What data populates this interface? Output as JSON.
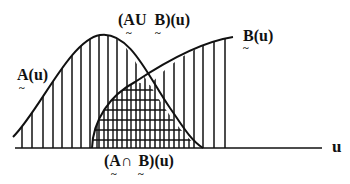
{
  "figure": {
    "type": "fuzzy-set-diagram",
    "axis_label": "u",
    "labels": {
      "a": "A(u)",
      "b": "B(u)",
      "union": "(A∪ B)(u)",
      "intersection": "(A∩ B)(u)"
    },
    "label_parts": {
      "a_letter": "A",
      "a_rest": "(u)",
      "b_letter": "B",
      "b_rest": "(u)",
      "union_open": "(A",
      "union_op": "U",
      "union_b": "B",
      "union_rest": ")(u)",
      "intersection_open": "(A",
      "intersection_op": "∩",
      "intersection_b": "B",
      "intersection_rest": ")(u)",
      "tilde": "~"
    },
    "colors": {
      "ink": "#111111",
      "background": "#ffffff"
    },
    "shading": {
      "union": "vertical-hatch",
      "intersection": "cross-hatch"
    }
  }
}
